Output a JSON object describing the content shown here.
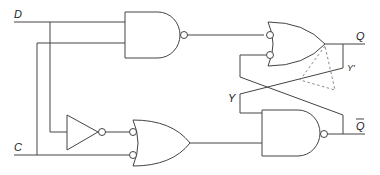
{
  "diagram": {
    "type": "logic-circuit",
    "labels": {
      "input_d": "D",
      "input_c": "C",
      "output_q": "Q",
      "output_qbar": "Q",
      "feedback_y": "Y",
      "feedback_y_prime": "Y'"
    },
    "gates": [
      {
        "id": "nand-top",
        "type": "NAND",
        "inputs": [
          "D",
          "C"
        ],
        "output": "to OR top input (inverted)"
      },
      {
        "id": "not",
        "type": "NOT",
        "inputs": [
          "D"
        ],
        "output": "to OR bottom-left input (inverted)"
      },
      {
        "id": "or-bottom-left",
        "type": "OR (inverted inputs)",
        "inputs": [
          "NOT D",
          "C"
        ],
        "output": "to NAND bottom input"
      },
      {
        "id": "or-top-right",
        "type": "OR (inverted inputs)",
        "inputs": [
          "NAND top",
          "Y (from Q-bar)"
        ],
        "output": "Q"
      },
      {
        "id": "nand-bottom-right",
        "type": "NAND",
        "inputs": [
          "Y (from Q)",
          "OR bottom-left"
        ],
        "output": "Q-bar"
      }
    ],
    "annotations": {
      "dashed_triangle": "alternative buffer placement shown dashed on feedback path Y'"
    }
  }
}
